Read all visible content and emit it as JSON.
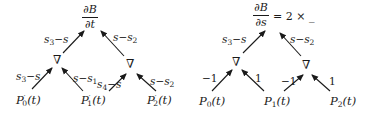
{
  "diagram_left": {
    "root": {
      "numerator": "∂B",
      "denominator": "∂t"
    },
    "inner_nodes": [
      "∇",
      "∇"
    ],
    "leaves": [
      {
        "name": "P",
        "sub": "0",
        "prime": "′",
        "arg": "(t)"
      },
      {
        "name": "P",
        "sub": "1",
        "prime": "′",
        "arg": "(t)"
      },
      {
        "name": "P",
        "sub": "2",
        "prime": "′",
        "arg": "(t)"
      }
    ],
    "edge_labels": {
      "left_node_to_root": {
        "a": "s",
        "a_sub": "3",
        "op": "−",
        "b": "s",
        "b_sub": ""
      },
      "right_node_to_root": {
        "a": "s",
        "a_sub": "",
        "op": "−",
        "b": "s",
        "b_sub": "2"
      },
      "p0_to_left_node": {
        "a": "s",
        "a_sub": "3",
        "op": "−",
        "b": "s",
        "b_sub": ""
      },
      "p1_to_left_node": {
        "a": "s",
        "a_sub": "",
        "op": "−",
        "b": "s",
        "b_sub": "1"
      },
      "p1_to_right_node": {
        "a": "s",
        "a_sub": "4",
        "op": "−",
        "b": "s",
        "b_sub": ""
      },
      "p2_to_right_node": {
        "a": "s",
        "a_sub": "",
        "op": "−",
        "b": "s",
        "b_sub": "2"
      }
    }
  },
  "diagram_right": {
    "root": {
      "numerator": "∂B",
      "denominator": "∂s",
      "suffix": "= 2 × _"
    },
    "inner_nodes": [
      "∇",
      "∇"
    ],
    "leaves": [
      {
        "name": "P",
        "sub": "0",
        "arg": "(t)"
      },
      {
        "name": "P",
        "sub": "1",
        "arg": "(t)"
      },
      {
        "name": "P",
        "sub": "2",
        "arg": "(t)"
      }
    ],
    "edge_labels": {
      "left_node_to_root": {
        "a": "s",
        "a_sub": "3",
        "op": "−",
        "b": "s",
        "b_sub": ""
      },
      "right_node_to_root": {
        "a": "s",
        "a_sub": "",
        "op": "−",
        "b": "s",
        "b_sub": "2"
      },
      "p0_to_left_node": "−1",
      "p1_to_left_node": "1",
      "p1_to_right_node": "−1",
      "p2_to_right_node": "1"
    }
  },
  "colors": {
    "ink": "#1a1a1a",
    "background": "#ffffff"
  }
}
